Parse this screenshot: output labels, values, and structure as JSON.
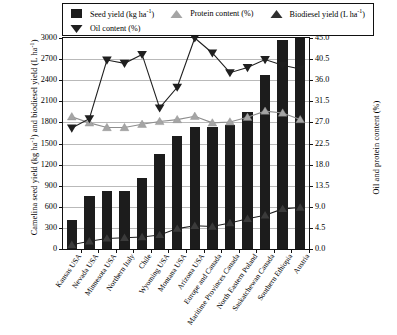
{
  "chart_data": {
    "type": "bar",
    "title": "",
    "xlabel": "",
    "ylabel": "Camelina seed yield (kg ha-1) and biodiesel yield (L ha-1)",
    "ylabel_right": "Oil and protein content (%)",
    "ylim": [
      0,
      3000
    ],
    "ylim_right": [
      0.0,
      45.0
    ],
    "grid": true,
    "legend_position": "top",
    "categories": [
      "Kansas USA",
      "Nevada USA",
      "Minnesota USA",
      "Northern Italy",
      "Chile",
      "Wyoming USA",
      "Montana USA",
      "Arizona USA",
      "Europe and Canada",
      "Maritime Provinces Canada",
      "North Eastern Poland",
      "Saskatchewan Canada",
      "Southern Ethiopia",
      "Austria"
    ],
    "series": [
      {
        "name": "Seed yield (kg ha-1)",
        "type": "bar",
        "axis": "left",
        "color": "#1c1c1c",
        "values": [
          410,
          750,
          820,
          820,
          1010,
          1350,
          1610,
          1730,
          1730,
          1770,
          1950,
          2480,
          2970,
          3000
        ]
      },
      {
        "name": "Biodiesel yield (L ha-1)",
        "type": "line",
        "marker": "triangle-up",
        "axis": "left",
        "color": "#3a3a3a",
        "values": [
          60,
          110,
          150,
          160,
          170,
          200,
          290,
          330,
          320,
          370,
          430,
          480,
          570,
          590
        ]
      },
      {
        "name": "Oil content (%)",
        "type": "line",
        "marker": "triangle-down",
        "axis": "right",
        "color": "#1f1f1f",
        "values": [
          25.8,
          27.8,
          40.3,
          39.6,
          41.5,
          30.1,
          34.5,
          45.0,
          41.8,
          37.6,
          38.7,
          40.4,
          39.2,
          38.4
        ]
      },
      {
        "name": "Protein content (%)",
        "type": "line",
        "marker": "triangle-up",
        "axis": "right",
        "color": "#a5a5a5",
        "values": [
          28.2,
          26.9,
          25.9,
          25.9,
          26.6,
          27.2,
          27.6,
          28.3,
          26.9,
          27.1,
          28.1,
          29.4,
          29.0,
          27.6
        ]
      }
    ],
    "yticks_left": [
      "0",
      "300",
      "600",
      "900",
      "1200",
      "1500",
      "1800",
      "2100",
      "2400",
      "2700",
      "3000"
    ],
    "yticks_right": [
      "0.0",
      "4.5",
      "9.0",
      "13.5",
      "18.0",
      "22.5",
      "27.0",
      "31.5",
      "36.0",
      "40.5",
      "45.0"
    ]
  },
  "legend": {
    "items": [
      {
        "label": "Seed yield (kg ha",
        "sup": "-1",
        "tail": ")",
        "key": "square-swatch",
        "name": "legend-key-seed-yield"
      },
      {
        "label": "Protein content (%)",
        "sup": "",
        "tail": "",
        "key": "triangle-up-light",
        "name": "legend-key-protein-content"
      },
      {
        "label": "Biodiesel yield (L ha",
        "sup": "-1",
        "tail": ")",
        "key": "triangle-up-dark",
        "name": "legend-key-biodiesel-yield"
      },
      {
        "label": "Oil content (%)",
        "sup": "",
        "tail": "",
        "key": "triangle-down-dark",
        "name": "legend-key-oil-content"
      }
    ]
  },
  "axes": {
    "left_title_a": "Camelina seed yield (kg ha",
    "left_title_sup": "-1",
    "left_title_b": ") and biodiesel yield (L ha",
    "left_title_sup2": "-1",
    "left_title_c": ")",
    "right_title": "Oil and protein content (%)"
  }
}
